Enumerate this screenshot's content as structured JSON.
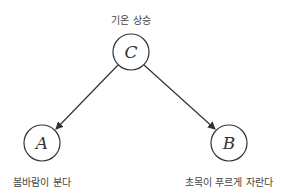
{
  "diagram": {
    "nodes": [
      {
        "id": "C",
        "label": "C",
        "caption": "기온 상승",
        "cx": 131,
        "cy": 52
      },
      {
        "id": "A",
        "label": "A",
        "caption": "봄바람이 분다",
        "cx": 42,
        "cy": 143
      },
      {
        "id": "B",
        "label": "B",
        "caption": "초목이 푸르게 자란다",
        "cx": 229,
        "cy": 143
      }
    ],
    "edges": [
      {
        "from": "C",
        "to": "A"
      },
      {
        "from": "C",
        "to": "B"
      }
    ],
    "colors": {
      "stroke": "#333333",
      "text": "#444444"
    }
  }
}
